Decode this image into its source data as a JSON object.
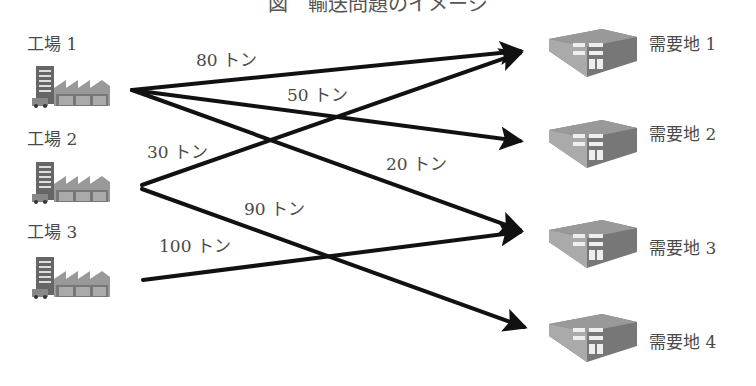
{
  "diagram": {
    "title": "図　輸送問題のイメージ",
    "factories": [
      {
        "label": "工場 1",
        "icon": "factory-icon"
      },
      {
        "label": "工場 2",
        "icon": "factory-icon"
      },
      {
        "label": "工場 3",
        "icon": "factory-icon"
      }
    ],
    "demand_points": [
      {
        "label": "需要地 1",
        "icon": "warehouse-icon"
      },
      {
        "label": "需要地 2",
        "icon": "warehouse-icon"
      },
      {
        "label": "需要地 3",
        "icon": "warehouse-icon"
      },
      {
        "label": "需要地 4",
        "icon": "warehouse-icon"
      }
    ],
    "flows": [
      {
        "from": "工場 1",
        "to": "需要地 1",
        "label": "80 トン"
      },
      {
        "from": "工場 1",
        "to": "需要地 2",
        "label": "50 トン"
      },
      {
        "from": "工場 1",
        "to": "需要地 3",
        "label": "20 トン"
      },
      {
        "from": "工場 2",
        "to": "需要地 1",
        "label": "30 トン"
      },
      {
        "from": "工場 2",
        "to": "需要地 4",
        "label": "90 トン"
      },
      {
        "from": "工場 3",
        "to": "需要地 3",
        "label": "100 トン"
      }
    ],
    "colors": {
      "arrow": "#111111",
      "text": "#4a4a4a",
      "icon_gray": "#8a8a8a",
      "icon_dark": "#555555"
    }
  }
}
